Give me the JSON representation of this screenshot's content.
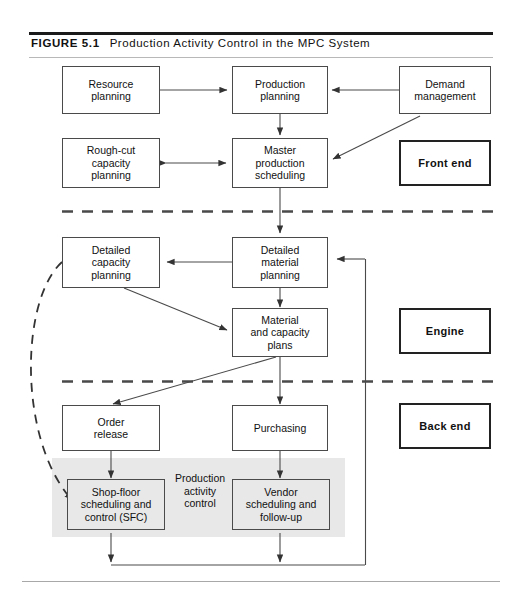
{
  "figure": {
    "label": "FIGURE 5.1",
    "title": "Production Activity Control in the MPC System"
  },
  "diagram": {
    "type": "flowchart",
    "sections": [
      {
        "id": "front-end",
        "label": "Front end"
      },
      {
        "id": "engine",
        "label": "Engine"
      },
      {
        "id": "back-end",
        "label": "Back end"
      }
    ],
    "nodes": [
      {
        "id": "resource-planning",
        "label": "Resource\nplanning"
      },
      {
        "id": "production-planning",
        "label": "Production\nplanning"
      },
      {
        "id": "demand-management",
        "label": "Demand\nmanagement"
      },
      {
        "id": "rough-cut-capacity-planning",
        "label": "Rough-cut\ncapacity\nplanning"
      },
      {
        "id": "master-production-scheduling",
        "label": "Master\nproduction\nscheduling"
      },
      {
        "id": "detailed-capacity-planning",
        "label": "Detailed\ncapacity\nplanning"
      },
      {
        "id": "detailed-material-planning",
        "label": "Detailed\nmaterial\nplanning"
      },
      {
        "id": "material-and-capacity-plans",
        "label": "Material\nand capacity\nplans"
      },
      {
        "id": "order-release",
        "label": "Order\nrelease"
      },
      {
        "id": "purchasing",
        "label": "Purchasing"
      },
      {
        "id": "shop-floor-scheduling-and-control",
        "label": "Shop-floor\nscheduling and\ncontrol (SFC)"
      },
      {
        "id": "vendor-scheduling-and-follow-up",
        "label": "Vendor\nscheduling and\nfollow-up"
      }
    ],
    "annotations": [
      {
        "id": "production-activity-control",
        "label": "Production\nactivity\ncontrol"
      }
    ],
    "colors": {
      "line": "#4a4a4a",
      "shade": "#e8e8e8",
      "rule": "#1a1a1a",
      "text": "#111111"
    }
  }
}
